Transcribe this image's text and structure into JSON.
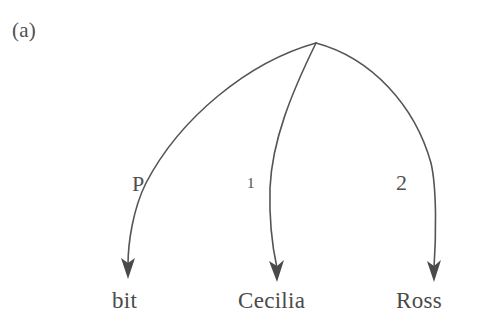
{
  "figure": {
    "panel_label": "(a)",
    "background_color": "#ffffff",
    "stroke_color": "#555555",
    "text_color": "#4a4a4a"
  },
  "diagram": {
    "type": "dependency-arc-diagram",
    "root": {
      "name": "root-node",
      "x": 316,
      "y": 43
    },
    "nodes": [
      {
        "id": "node-bit",
        "label": "bit",
        "x": 128,
        "y": 297
      },
      {
        "id": "node-cecilia",
        "label": "Cecilia",
        "x": 277,
        "y": 297
      },
      {
        "id": "node-ross",
        "label": "Ross",
        "x": 434,
        "y": 297
      }
    ],
    "edges": [
      {
        "id": "edge-p",
        "label": "P",
        "from": "root-node",
        "to": "node-bit",
        "label_x": 132,
        "label_y": 173,
        "arrowhead": {
          "x": 128,
          "y": 278
        }
      },
      {
        "id": "edge-1",
        "label": "1",
        "from": "root-node",
        "to": "node-cecilia",
        "label_x": 247,
        "label_y": 176,
        "arrowhead": {
          "x": 277,
          "y": 281
        }
      },
      {
        "id": "edge-2",
        "label": "2",
        "from": "root-node",
        "to": "node-ross",
        "label_x": 396,
        "label_y": 172,
        "arrowhead": {
          "x": 434,
          "y": 281
        }
      }
    ]
  }
}
